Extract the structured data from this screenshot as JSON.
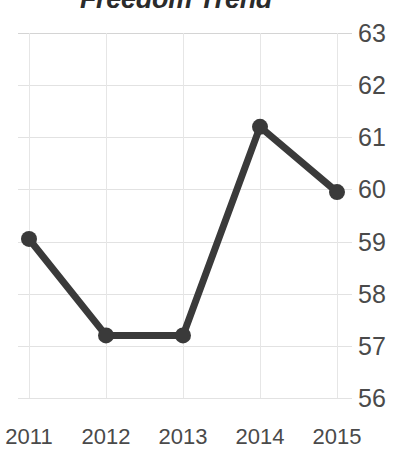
{
  "chart_data": {
    "type": "line",
    "title": "Freedom Trend",
    "xlabel": "",
    "ylabel": "",
    "categories": [
      "2011",
      "2012",
      "2013",
      "2014",
      "2015"
    ],
    "values": [
      59.05,
      57.2,
      57.2,
      61.2,
      59.95
    ],
    "series": [
      {
        "name": "Freedom Trend",
        "values": [
          59.05,
          57.2,
          57.2,
          61.2,
          59.95
        ]
      }
    ],
    "ylim": [
      56,
      63
    ],
    "yticks": [
      "56",
      "57",
      "58",
      "59",
      "60",
      "61",
      "62",
      "63"
    ],
    "xticks": [
      "2011",
      "2012",
      "2013",
      "2014",
      "2015"
    ],
    "grid": true,
    "y_axis_position": "right",
    "legend": false,
    "legend_position": "none",
    "marker": "circle",
    "colors": {
      "line": "#3a3a3a",
      "marker": "#3a3a3a",
      "grid": "#e2e2e2",
      "text": "#4a4a4a",
      "title": "#2b2b2b",
      "background": "#ffffff"
    }
  }
}
